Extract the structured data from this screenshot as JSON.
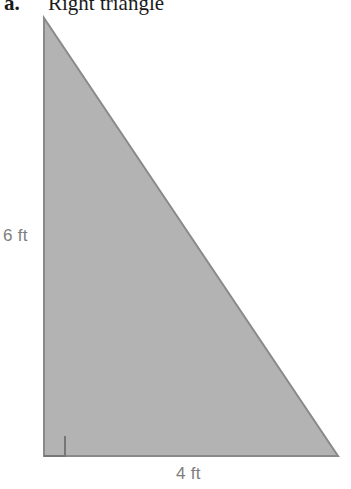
{
  "heading": {
    "item_label": "a.",
    "title": "Right triangle"
  },
  "figure": {
    "shape_name": "right-triangle",
    "fill_color": "#b3b3b3",
    "stroke_color": "#8a8a8a",
    "background_color": "#ffffff",
    "right_angle_marker": "right-angle-square",
    "vertices": {
      "apex": [
        44,
        18
      ],
      "bottom_left": [
        44,
        456
      ],
      "bottom_right": [
        338,
        456
      ]
    }
  },
  "labels": {
    "height": "6 ft",
    "base": "4 ft",
    "text_color": "#7d7d7d"
  }
}
